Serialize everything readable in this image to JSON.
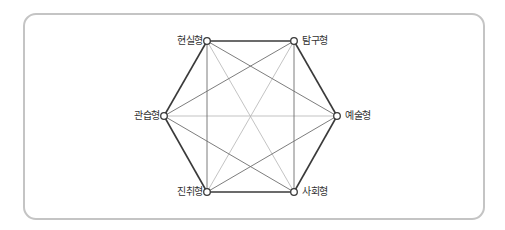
{
  "diagram": {
    "type": "hexagon-model",
    "colors": {
      "frame": "#c4c4c4",
      "outer_edge": "#3a3a3a",
      "secondary_edge": "#6e6e6e",
      "center_edge": "#b4b4b4",
      "node_fill": "#ffffff",
      "node_stroke": "#3a3a3a",
      "label": "#333333"
    },
    "nodes": [
      {
        "id": "realistic",
        "label": "현실형",
        "x": 207,
        "y": 41,
        "label_side": "left"
      },
      {
        "id": "investigative",
        "label": "탐구형",
        "x": 294,
        "y": 41,
        "label_side": "right"
      },
      {
        "id": "artistic",
        "label": "예술형",
        "x": 337,
        "y": 116,
        "label_side": "right"
      },
      {
        "id": "social",
        "label": "사회형",
        "x": 294,
        "y": 192,
        "label_side": "right"
      },
      {
        "id": "enterprising",
        "label": "진취형",
        "x": 207,
        "y": 192,
        "label_side": "left"
      },
      {
        "id": "conventional",
        "label": "관습형",
        "x": 164,
        "y": 116,
        "label_side": "left"
      }
    ]
  }
}
